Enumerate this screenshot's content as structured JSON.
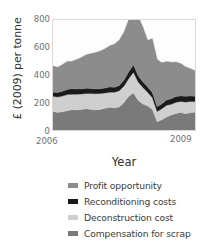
{
  "chart_data": {
    "type": "area",
    "stacked": true,
    "title": "",
    "xlabel": "Year",
    "ylabel": "£ (2009) per tonne",
    "xlim": [
      2006,
      2009
    ],
    "ylim": [
      0,
      800
    ],
    "yticks": [
      0,
      200,
      400,
      600,
      800
    ],
    "xticks": [
      2006,
      2009
    ],
    "xtick_labels": [
      "2006",
      "2009"
    ],
    "grid": false,
    "legend_position": "below",
    "colors": {
      "profit_opportunity": "#8c8c8c",
      "reconditioning_costs": "#1a1a1a",
      "deconstruction_cost": "#cfcfcf",
      "compensation_for_scrap": "#7a7a7a",
      "plot_background": "#fdfdfd",
      "axis": "#d8d8d8",
      "text": "#3a3a3a",
      "tick_text": "#6f6f6f"
    },
    "x": [
      2006.0,
      2006.1,
      2006.2,
      2006.3,
      2006.4,
      2006.5,
      2006.6,
      2006.7,
      2006.8,
      2006.9,
      2007.0,
      2007.1,
      2007.2,
      2007.3,
      2007.4,
      2007.5,
      2007.6,
      2007.7,
      2007.8,
      2007.9,
      2008.0,
      2008.1,
      2008.2,
      2008.3,
      2008.4,
      2008.5,
      2008.6,
      2008.7,
      2008.8,
      2008.9,
      2009.0
    ],
    "series": [
      {
        "name": "Compensation for scrap",
        "color": "#7a7a7a",
        "values": [
          135,
          128,
          132,
          140,
          148,
          145,
          150,
          155,
          150,
          146,
          150,
          158,
          165,
          160,
          168,
          200,
          245,
          270,
          215,
          190,
          175,
          150,
          60,
          75,
          95,
          110,
          120,
          128,
          118,
          125,
          130
        ]
      },
      {
        "name": "Deconstruction cost",
        "color": "#cfcfcf",
        "values": [
          110,
          112,
          115,
          118,
          112,
          115,
          112,
          110,
          115,
          118,
          115,
          112,
          110,
          115,
          118,
          120,
          130,
          150,
          135,
          120,
          100,
          85,
          75,
          80,
          85,
          78,
          82,
          80,
          85,
          82,
          78
        ]
      },
      {
        "name": "Reconditioning costs",
        "color": "#1a1a1a",
        "values": [
          30,
          32,
          34,
          36,
          40,
          38,
          36,
          38,
          36,
          34,
          35,
          36,
          38,
          36,
          38,
          42,
          48,
          52,
          45,
          40,
          38,
          36,
          34,
          35,
          38,
          40,
          42,
          40,
          42,
          40,
          38
        ]
      },
      {
        "name": "Profit opportunity",
        "color": "#8c8c8c",
        "values": [
          190,
          185,
          195,
          205,
          200,
          215,
          230,
          245,
          255,
          265,
          275,
          285,
          300,
          315,
          330,
          350,
          380,
          405,
          430,
          400,
          340,
          395,
          345,
          300,
          280,
          265,
          250,
          235,
          215,
          200,
          185
        ]
      }
    ]
  },
  "axes": {
    "ylabel": "£ (2009) per tonne",
    "xlabel": "Year",
    "ytick_labels": [
      "800",
      "600",
      "400",
      "200",
      "0"
    ],
    "xtick_left": "2006",
    "xtick_right": "2009"
  },
  "legend": {
    "items": [
      {
        "label": "Profit opportunity",
        "color": "#8c8c8c"
      },
      {
        "label": "Reconditioning costs",
        "color": "#1a1a1a"
      },
      {
        "label": "Deconstruction cost",
        "color": "#cfcfcf"
      },
      {
        "label": "Compensation for scrap",
        "color": "#7a7a7a"
      }
    ]
  }
}
